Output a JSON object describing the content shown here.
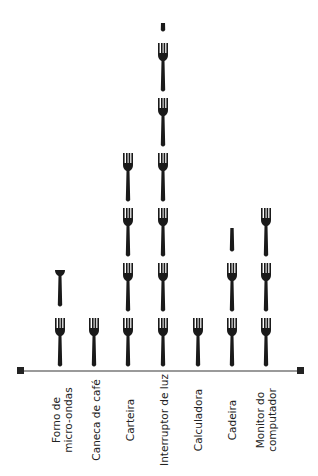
{
  "chart_data": {
    "type": "pictograph",
    "title": "",
    "icon": "fork-icon",
    "categories": [
      "Forno de\nmicro-ondas",
      "Caneca de café",
      "Carteira",
      "Interruptor de luz",
      "Calculadora",
      "Cadeira",
      "Monitor do\ncomputador"
    ],
    "values": [
      1.75,
      1,
      4,
      6.2,
      1,
      2.5,
      3
    ],
    "xlabel": "",
    "ylabel": "",
    "grid": false,
    "legend": null
  },
  "colors": {
    "icon": "#1a1a1a",
    "axis": "#9a9a9a",
    "axis_cap": "#222222",
    "text": "#222222"
  },
  "layout": {
    "column_centers": [
      60,
      94,
      128,
      163,
      198,
      232,
      266
    ],
    "baseline_y": 368,
    "icon_height": 50,
    "icon_spacing": 55
  }
}
